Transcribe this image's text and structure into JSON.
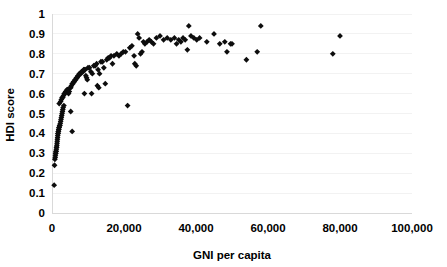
{
  "chart_data": {
    "type": "scatter",
    "title": "",
    "xlabel": "GNI per capita",
    "ylabel": "HDI score",
    "xlim": [
      0,
      100000
    ],
    "ylim": [
      0,
      1
    ],
    "xticks": [
      0,
      20000,
      40000,
      60000,
      80000,
      100000
    ],
    "xtick_labels": [
      "0",
      "20,000",
      "40,000",
      "60,000",
      "80,000",
      "100,000"
    ],
    "yticks": [
      0,
      0.1,
      0.2,
      0.3,
      0.4,
      0.5,
      0.6,
      0.7,
      0.8,
      0.9,
      1
    ],
    "ytick_labels": [
      "0",
      "0.1",
      "0.2",
      "0.3",
      "0.4",
      "0.5",
      "0.6",
      "0.7",
      "0.8",
      "0.9",
      "1"
    ],
    "grid": true,
    "grid_axis": "y",
    "legend": false,
    "marker": "diamond",
    "marker_color": "#0d0d0d",
    "marker_size": 4,
    "series": [
      {
        "name": "Countries",
        "points": [
          [
            600,
            0.14
          ],
          [
            700,
            0.24
          ],
          [
            800,
            0.27
          ],
          [
            900,
            0.28
          ],
          [
            950,
            0.29
          ],
          [
            1000,
            0.3
          ],
          [
            1050,
            0.3
          ],
          [
            1100,
            0.31
          ],
          [
            1150,
            0.31
          ],
          [
            1200,
            0.32
          ],
          [
            1250,
            0.33
          ],
          [
            1300,
            0.33
          ],
          [
            1350,
            0.34
          ],
          [
            1400,
            0.35
          ],
          [
            1450,
            0.36
          ],
          [
            1500,
            0.37
          ],
          [
            1550,
            0.38
          ],
          [
            1600,
            0.39
          ],
          [
            1650,
            0.4
          ],
          [
            1700,
            0.4
          ],
          [
            1750,
            0.41
          ],
          [
            1800,
            0.41
          ],
          [
            1850,
            0.42
          ],
          [
            1900,
            0.42
          ],
          [
            1950,
            0.43
          ],
          [
            2000,
            0.43
          ],
          [
            2100,
            0.44
          ],
          [
            2200,
            0.44
          ],
          [
            2300,
            0.45
          ],
          [
            2400,
            0.46
          ],
          [
            2500,
            0.47
          ],
          [
            2600,
            0.48
          ],
          [
            2700,
            0.49
          ],
          [
            2800,
            0.5
          ],
          [
            2900,
            0.51
          ],
          [
            3000,
            0.52
          ],
          [
            3100,
            0.53
          ],
          [
            3300,
            0.54
          ],
          [
            5200,
            0.51
          ],
          [
            5600,
            0.41
          ],
          [
            2000,
            0.55
          ],
          [
            2400,
            0.56
          ],
          [
            2600,
            0.57
          ],
          [
            2800,
            0.58
          ],
          [
            3000,
            0.58
          ],
          [
            3200,
            0.59
          ],
          [
            3400,
            0.6
          ],
          [
            3600,
            0.6
          ],
          [
            3800,
            0.61
          ],
          [
            4000,
            0.61
          ],
          [
            4200,
            0.62
          ],
          [
            4400,
            0.62
          ],
          [
            4600,
            0.6
          ],
          [
            4800,
            0.61
          ],
          [
            5000,
            0.63
          ],
          [
            5200,
            0.63
          ],
          [
            5400,
            0.64
          ],
          [
            5600,
            0.65
          ],
          [
            5800,
            0.65
          ],
          [
            6000,
            0.66
          ],
          [
            6200,
            0.66
          ],
          [
            6400,
            0.67
          ],
          [
            6600,
            0.67
          ],
          [
            6800,
            0.68
          ],
          [
            7000,
            0.68
          ],
          [
            7200,
            0.69
          ],
          [
            7400,
            0.69
          ],
          [
            7600,
            0.7
          ],
          [
            7800,
            0.7
          ],
          [
            8000,
            0.7
          ],
          [
            8200,
            0.71
          ],
          [
            8400,
            0.71
          ],
          [
            8600,
            0.71
          ],
          [
            8800,
            0.72
          ],
          [
            9000,
            0.72
          ],
          [
            9200,
            0.72
          ],
          [
            9400,
            0.69
          ],
          [
            9600,
            0.68
          ],
          [
            9800,
            0.67
          ],
          [
            10000,
            0.73
          ],
          [
            10400,
            0.73
          ],
          [
            10800,
            0.71
          ],
          [
            11200,
            0.7
          ],
          [
            11600,
            0.74
          ],
          [
            12000,
            0.74
          ],
          [
            12400,
            0.75
          ],
          [
            12800,
            0.72
          ],
          [
            13200,
            0.7
          ],
          [
            13600,
            0.76
          ],
          [
            14000,
            0.76
          ],
          [
            14400,
            0.73
          ],
          [
            14800,
            0.65
          ],
          [
            15200,
            0.77
          ],
          [
            15600,
            0.78
          ],
          [
            16000,
            0.78
          ],
          [
            16400,
            0.79
          ],
          [
            16800,
            0.75
          ],
          [
            17200,
            0.79
          ],
          [
            11000,
            0.6
          ],
          [
            12600,
            0.64
          ],
          [
            13000,
            0.63
          ],
          [
            9000,
            0.6
          ],
          [
            18000,
            0.8
          ],
          [
            18600,
            0.79
          ],
          [
            19200,
            0.8
          ],
          [
            19800,
            0.81
          ],
          [
            20400,
            0.81
          ],
          [
            21000,
            0.54
          ],
          [
            21600,
            0.83
          ],
          [
            22200,
            0.84
          ],
          [
            22800,
            0.79
          ],
          [
            23000,
            0.75
          ],
          [
            23400,
            0.74
          ],
          [
            23800,
            0.9
          ],
          [
            24200,
            0.88
          ],
          [
            24600,
            0.8
          ],
          [
            25000,
            0.81
          ],
          [
            25400,
            0.86
          ],
          [
            25800,
            0.85
          ],
          [
            26400,
            0.86
          ],
          [
            27000,
            0.87
          ],
          [
            27600,
            0.86
          ],
          [
            28200,
            0.85
          ],
          [
            29000,
            0.88
          ],
          [
            30000,
            0.89
          ],
          [
            31000,
            0.87
          ],
          [
            32000,
            0.88
          ],
          [
            33000,
            0.87
          ],
          [
            34000,
            0.88
          ],
          [
            34600,
            0.85
          ],
          [
            35200,
            0.87
          ],
          [
            35800,
            0.86
          ],
          [
            36400,
            0.88
          ],
          [
            37000,
            0.87
          ],
          [
            37600,
            0.82
          ],
          [
            38000,
            0.94
          ],
          [
            38600,
            0.89
          ],
          [
            39400,
            0.88
          ],
          [
            40200,
            0.87
          ],
          [
            41000,
            0.88
          ],
          [
            43000,
            0.86
          ],
          [
            45000,
            0.9
          ],
          [
            46600,
            0.85
          ],
          [
            48000,
            0.86
          ],
          [
            48600,
            0.81
          ],
          [
            49600,
            0.85
          ],
          [
            50000,
            0.85
          ],
          [
            54000,
            0.77
          ],
          [
            57000,
            0.81
          ],
          [
            58000,
            0.94
          ],
          [
            78000,
            0.8
          ],
          [
            80000,
            0.89
          ]
        ]
      }
    ]
  }
}
